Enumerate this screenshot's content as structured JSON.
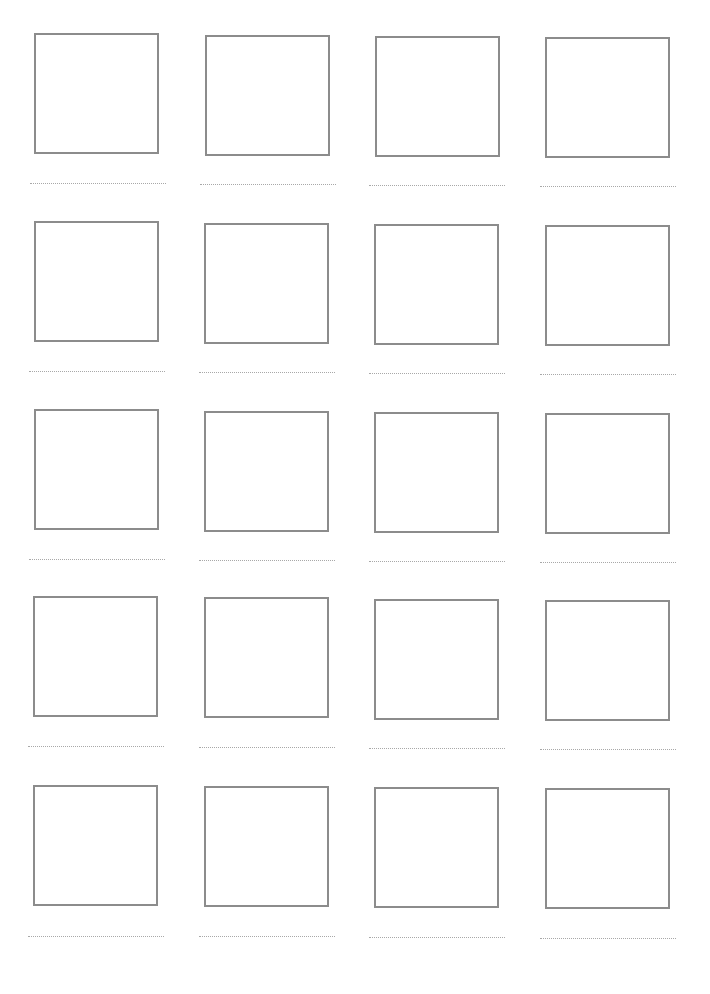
{
  "page": {
    "type": "storyboard-template",
    "rows": 5,
    "columns": 4,
    "frame_border_color": "#8c8c8c",
    "caption_line_color": "#a8a8a8"
  },
  "frames": [
    {
      "row": 1,
      "col": 1,
      "caption": ""
    },
    {
      "row": 1,
      "col": 2,
      "caption": ""
    },
    {
      "row": 1,
      "col": 3,
      "caption": ""
    },
    {
      "row": 1,
      "col": 4,
      "caption": ""
    },
    {
      "row": 2,
      "col": 1,
      "caption": ""
    },
    {
      "row": 2,
      "col": 2,
      "caption": ""
    },
    {
      "row": 2,
      "col": 3,
      "caption": ""
    },
    {
      "row": 2,
      "col": 4,
      "caption": ""
    },
    {
      "row": 3,
      "col": 1,
      "caption": ""
    },
    {
      "row": 3,
      "col": 2,
      "caption": ""
    },
    {
      "row": 3,
      "col": 3,
      "caption": ""
    },
    {
      "row": 3,
      "col": 4,
      "caption": ""
    },
    {
      "row": 4,
      "col": 1,
      "caption": ""
    },
    {
      "row": 4,
      "col": 2,
      "caption": ""
    },
    {
      "row": 4,
      "col": 3,
      "caption": ""
    },
    {
      "row": 4,
      "col": 4,
      "caption": ""
    },
    {
      "row": 5,
      "col": 1,
      "caption": ""
    },
    {
      "row": 5,
      "col": 2,
      "caption": ""
    },
    {
      "row": 5,
      "col": 3,
      "caption": ""
    },
    {
      "row": 5,
      "col": 4,
      "caption": ""
    }
  ]
}
